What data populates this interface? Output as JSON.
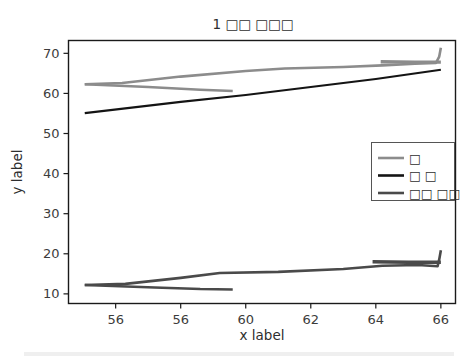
{
  "chart_data": {
    "type": "line",
    "title": "1 □□ □□□",
    "xlabel": "x label",
    "ylabel": "y label",
    "xlim": [
      54.55,
      66.45
    ],
    "ylim": [
      7.6,
      73.2
    ],
    "xticks": [
      56,
      56,
      60,
      62,
      64,
      66
    ],
    "xtick_labels": [
      "56",
      "56",
      "60",
      "62",
      "64",
      "66"
    ],
    "xtick_positions": [
      56,
      58,
      60,
      62,
      64,
      66
    ],
    "yticks": [
      10,
      20,
      30,
      40,
      50,
      60,
      70
    ],
    "ytick_labels": [
      "10",
      "20",
      "30",
      "40",
      "50",
      "60",
      "70"
    ],
    "grid": false,
    "legend_position": "center right",
    "series": [
      {
        "name": "□",
        "color": "#8c8c8c",
        "width": 2.6,
        "points": [
          [
            55.05,
            62.3
          ],
          [
            56.2,
            62.6
          ],
          [
            58.0,
            64.2
          ],
          [
            60.0,
            65.6
          ],
          [
            61.2,
            66.2
          ],
          [
            63.0,
            66.6
          ],
          [
            64.2,
            67.0
          ],
          [
            65.2,
            67.4
          ],
          [
            65.85,
            67.6
          ],
          [
            65.95,
            69.2
          ],
          [
            66.0,
            71.4
          ]
        ]
      },
      {
        "name": "□ □",
        "color": "#141414",
        "width": 2.2,
        "points": [
          [
            55.05,
            55.1
          ],
          [
            58.0,
            57.9
          ],
          [
            60.0,
            59.6
          ],
          [
            62.0,
            61.6
          ],
          [
            64.0,
            63.6
          ],
          [
            66.0,
            65.9
          ]
        ]
      },
      {
        "name": "□□ □□",
        "color": "#4a4a4a",
        "width": 2.6,
        "points": [
          [
            55.05,
            12.2
          ],
          [
            56.3,
            12.5
          ],
          [
            58.0,
            14.0
          ],
          [
            59.2,
            15.2
          ],
          [
            61.0,
            15.5
          ],
          [
            63.0,
            16.2
          ],
          [
            64.2,
            17.0
          ],
          [
            65.3,
            17.2
          ],
          [
            65.9,
            16.9
          ],
          [
            65.95,
            18.6
          ],
          [
            66.0,
            20.9
          ]
        ]
      },
      {
        "name": "branch-upper-lower",
        "color": "#8c8c8c",
        "width": 2.6,
        "points": [
          [
            55.05,
            62.3
          ],
          [
            57.0,
            61.6
          ],
          [
            58.6,
            60.9
          ],
          [
            59.6,
            60.6
          ]
        ]
      },
      {
        "name": "branch-upper-plateau",
        "color": "#8c8c8c",
        "width": 3.4,
        "points": [
          [
            64.15,
            67.9
          ],
          [
            65.2,
            67.8
          ],
          [
            66.0,
            67.8
          ]
        ]
      },
      {
        "name": "branch-lower-lower",
        "color": "#4a4a4a",
        "width": 2.6,
        "points": [
          [
            55.05,
            12.2
          ],
          [
            57.2,
            11.6
          ],
          [
            58.6,
            11.2
          ],
          [
            59.6,
            11.1
          ]
        ]
      },
      {
        "name": "branch-lower-plateau",
        "color": "#4a4a4a",
        "width": 3.4,
        "points": [
          [
            63.9,
            18.0
          ],
          [
            65.0,
            17.9
          ],
          [
            66.0,
            17.9
          ]
        ]
      }
    ],
    "legend_entries": [
      {
        "label": "□",
        "color": "#8c8c8c"
      },
      {
        "label": "□ □",
        "color": "#141414"
      },
      {
        "label": "□□ □□",
        "color": "#4a4a4a"
      }
    ]
  },
  "figure": {
    "background": "#ffffff",
    "frame_color": "#1a1a1a"
  }
}
